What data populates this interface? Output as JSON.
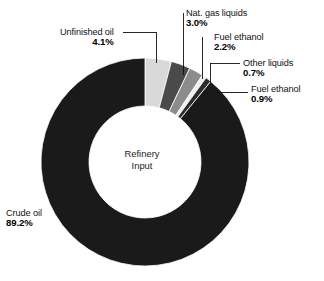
{
  "chart_data": {
    "type": "pie",
    "variant": "donut",
    "title": "",
    "center_label_lines": [
      "Refinery",
      "Input"
    ],
    "unit": "%",
    "start_angle_deg": 0,
    "direction": "clockwise",
    "categories": [
      "Unfinished oil",
      "Nat. gas liquids",
      "Fuel ethanol",
      "Other liquids",
      "Fuel ethanol",
      "Crude oil"
    ],
    "values": [
      4.1,
      3.0,
      2.2,
      0.7,
      0.9,
      89.2
    ],
    "colors": [
      "#d9d9d9",
      "#4a4a4a",
      "#8c8c8c",
      "#f0f0f0",
      "#2b2b2b",
      "#1a1a1a"
    ],
    "slices": [
      {
        "label": "Unfinished oil",
        "value": 4.1,
        "display": "4.1%",
        "color": "#d9d9d9"
      },
      {
        "label": "Nat. gas liquids",
        "value": 3.0,
        "display": "3.0%",
        "color": "#4a4a4a"
      },
      {
        "label": "Fuel ethanol",
        "value": 2.2,
        "display": "2.2%",
        "color": "#8c8c8c"
      },
      {
        "label": "Other liquids",
        "value": 0.7,
        "display": "0.7%",
        "color": "#f0f0f0"
      },
      {
        "label": "Fuel ethanol",
        "value": 0.9,
        "display": "0.9%",
        "color": "#2b2b2b"
      },
      {
        "label": "Crude oil",
        "value": 89.2,
        "display": "89.2%",
        "color": "#1a1a1a"
      }
    ],
    "legend": "callouts",
    "grid": false
  },
  "callouts": {
    "unfinished_oil": {
      "name": "Unfinished oil",
      "value": "4.1%"
    },
    "nat_gas_liquids": {
      "name": "Nat. gas liquids",
      "value": "3.0%"
    },
    "fuel_ethanol_top": {
      "name": "Fuel ethanol",
      "value": "2.2%"
    },
    "other_liquids": {
      "name": "Other liquids",
      "value": "0.7%"
    },
    "fuel_ethanol_low": {
      "name": "Fuel ethanol",
      "value": "0.9%"
    },
    "crude_oil": {
      "name": "Crude oil",
      "value": "89.2%"
    }
  },
  "center": {
    "line1": "Refinery",
    "line2": "Input"
  }
}
